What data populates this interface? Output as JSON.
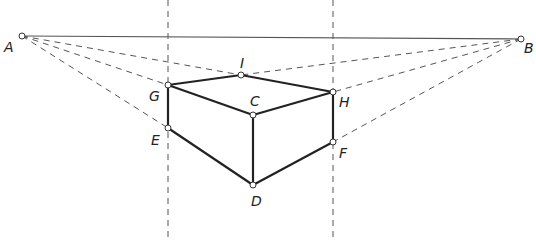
{
  "diagram": {
    "colors": {
      "solid": "#222222",
      "horizon": "#555555",
      "dashed": "#555555",
      "point_fill": "#ffffff"
    },
    "points": [
      {
        "id": "A",
        "x": 22,
        "y": 36,
        "label": "A",
        "lx": 4,
        "ly": 40
      },
      {
        "id": "B",
        "x": 521,
        "y": 39,
        "label": "B",
        "lx": 524,
        "ly": 41
      },
      {
        "id": "I",
        "x": 241,
        "y": 75,
        "label": "I",
        "lx": 240,
        "ly": 56
      },
      {
        "id": "G",
        "x": 168,
        "y": 85,
        "label": "G",
        "lx": 149,
        "ly": 89
      },
      {
        "id": "H",
        "x": 333,
        "y": 92,
        "label": "H",
        "lx": 339,
        "ly": 95
      },
      {
        "id": "C",
        "x": 253,
        "y": 115,
        "label": "C",
        "lx": 250,
        "ly": 94
      },
      {
        "id": "E",
        "x": 168,
        "y": 128,
        "label": "E",
        "lx": 151,
        "ly": 133
      },
      {
        "id": "F",
        "x": 333,
        "y": 142,
        "label": "F",
        "lx": 339,
        "ly": 146
      },
      {
        "id": "D",
        "x": 253,
        "y": 185,
        "label": "D",
        "lx": 251,
        "ly": 194
      }
    ],
    "horizon_line": [
      "A",
      "B"
    ],
    "vertical_guides": [
      {
        "x": 168,
        "y1": 0,
        "y2": 240
      },
      {
        "x": 333,
        "y1": 0,
        "y2": 240
      }
    ],
    "dashed_lines": [
      [
        "A",
        "I"
      ],
      [
        "A",
        "G"
      ],
      [
        "A",
        "E"
      ],
      [
        "B",
        "I"
      ],
      [
        "B",
        "H"
      ],
      [
        "B",
        "F"
      ]
    ],
    "solid_edges": [
      [
        "G",
        "I"
      ],
      [
        "I",
        "H"
      ],
      [
        "G",
        "C"
      ],
      [
        "C",
        "H"
      ],
      [
        "G",
        "E"
      ],
      [
        "C",
        "D"
      ],
      [
        "H",
        "F"
      ],
      [
        "E",
        "D"
      ],
      [
        "F",
        "D"
      ]
    ]
  }
}
